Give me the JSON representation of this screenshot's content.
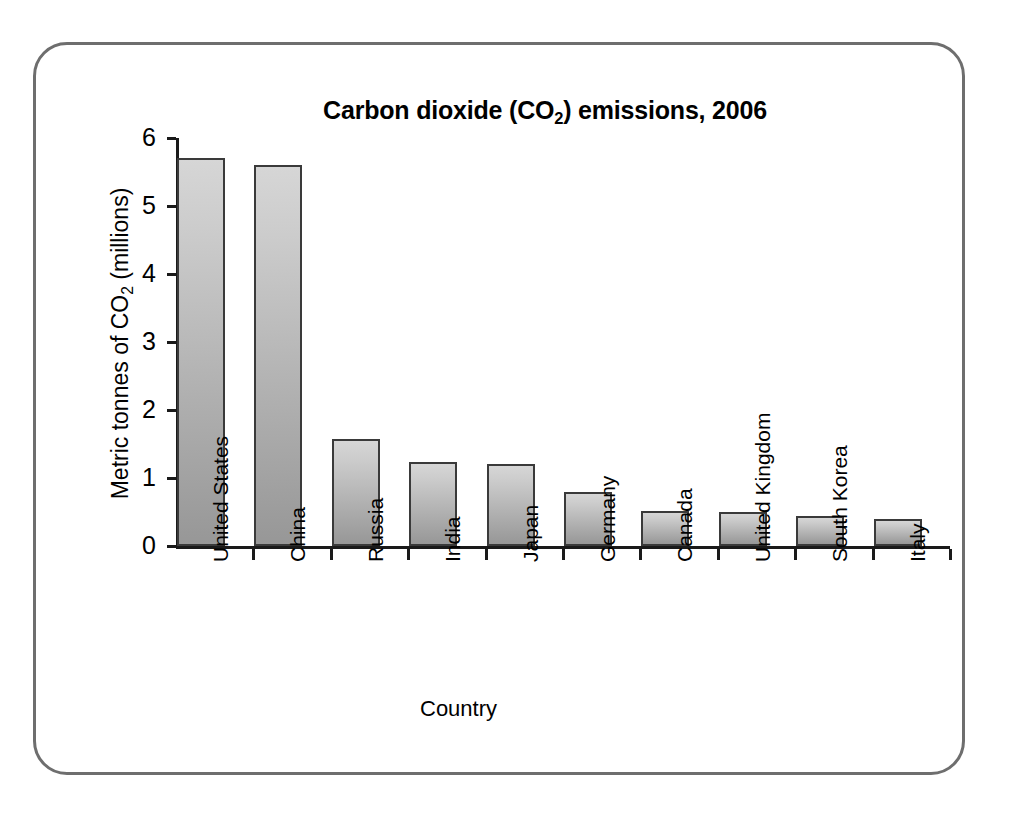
{
  "frame": {
    "border_color": "#6e6e6e"
  },
  "chart_data": {
    "type": "bar",
    "title": "Carbon dioxide (CO2) emissions, 2006",
    "title_parts": {
      "before": "Carbon dioxide (CO",
      "sub": "2",
      "after": ") emissions, 2006"
    },
    "xlabel": "Country",
    "ylabel": "Metric tonnes of CO2 (millions)",
    "ylabel_parts": {
      "before": "Metric tonnes of CO",
      "sub": "2",
      "after": " (millions)"
    },
    "categories": [
      "United States",
      "China",
      "Russia",
      "India",
      "Japan",
      "Germany",
      "Canada",
      "United Kingdom",
      "South Korea",
      "Italy"
    ],
    "values": [
      5.7,
      5.6,
      1.57,
      1.24,
      1.2,
      0.8,
      0.51,
      0.5,
      0.44,
      0.4
    ],
    "ylim": [
      0,
      6
    ],
    "yticks": [
      "0",
      "1",
      "2",
      "3",
      "4",
      "5",
      "6"
    ],
    "grid": false,
    "legend": null,
    "bar_fill_top": "#d6d6d6",
    "bar_fill_bottom": "#979797",
    "bar_border": "#3a3a3a",
    "axis_color": "#1a1a1a"
  }
}
